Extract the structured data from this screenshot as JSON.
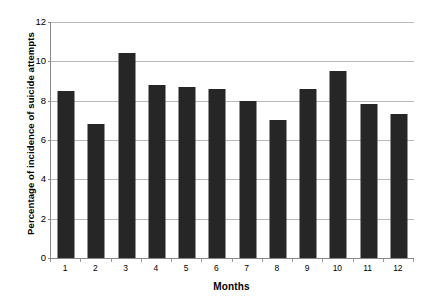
{
  "chart_data": {
    "type": "bar",
    "title": "",
    "subtitle": "",
    "xlabel": "Months",
    "ylabel": "Percentage of incidence of suicide attempts",
    "categories": [
      "1",
      "2",
      "3",
      "4",
      "5",
      "6",
      "7",
      "8",
      "9",
      "10",
      "11",
      "12"
    ],
    "values": [
      8.5,
      6.8,
      10.4,
      8.8,
      8.7,
      8.6,
      8.0,
      7.0,
      8.6,
      9.5,
      7.85,
      7.3
    ],
    "ylim": [
      0,
      12
    ],
    "ytick_labels": [
      "0",
      "2",
      "4",
      "6",
      "8",
      "10",
      "12"
    ],
    "ytick_values": [
      0,
      2,
      4,
      6,
      8,
      10,
      12
    ],
    "grid": "horizontal",
    "legend": "none",
    "bar_color": "#262626",
    "gridline_color": "#b9b9b9",
    "axis_color": "#888888",
    "background_color": "#ffffff",
    "annotations": []
  }
}
